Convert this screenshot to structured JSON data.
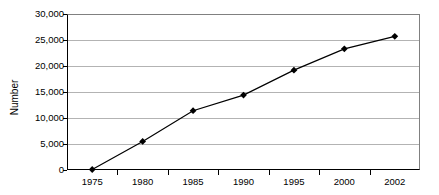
{
  "chart_data": {
    "type": "line",
    "title": "",
    "xlabel": "",
    "ylabel": "Number",
    "categories": [
      "1975",
      "1980",
      "1985",
      "1990",
      "1995",
      "2000",
      "2002"
    ],
    "values": [
      100,
      5500,
      11400,
      14400,
      19200,
      23300,
      25700
    ],
    "series": [
      {
        "name": "Number",
        "values": [
          100,
          5500,
          11400,
          14400,
          19200,
          23300,
          25700
        ]
      }
    ],
    "ylim": [
      0,
      30000
    ],
    "ytick_values": [
      0,
      5000,
      10000,
      15000,
      20000,
      25000,
      30000
    ],
    "ytick_labels": [
      "0",
      "5,000",
      "10,000",
      "15,000",
      "20,000",
      "25,000",
      "30,000"
    ],
    "grid": true,
    "grid_axis": "y",
    "legend": false,
    "legend_position": "none",
    "marker": "diamond",
    "marker_color": "#000000",
    "line_color": "#000000",
    "background_color": "#ffffff",
    "gridline_color": "#b3b3b3",
    "axis_color": "#000000"
  }
}
